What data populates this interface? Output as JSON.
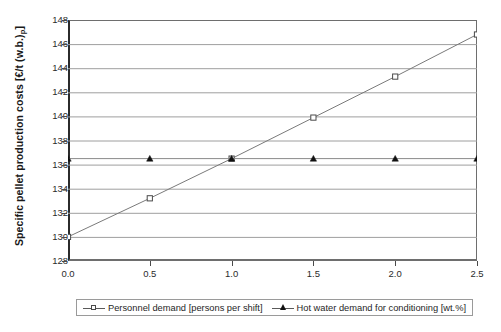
{
  "chart_data": {
    "type": "line",
    "title": "",
    "xlabel": "",
    "ylabel_text": "Specific pellet production costs [€/t (w.b.)",
    "ylabel_sub": "p",
    "ylabel_tail": "]",
    "ylabel_full": "Specific pellet production costs [€/t (w.b.)p]",
    "x": [
      0.0,
      0.5,
      1.0,
      1.5,
      2.0,
      2.5
    ],
    "xtick_labels": [
      "0.0",
      "0.5",
      "1.0",
      "1.5",
      "2.0",
      "2.5"
    ],
    "ytick_labels": [
      "148",
      "146",
      "144",
      "142",
      "140",
      "138",
      "136",
      "134",
      "132",
      "130",
      "128"
    ],
    "yticks": [
      148,
      146,
      144,
      142,
      140,
      138,
      136,
      134,
      132,
      130,
      128
    ],
    "xlim": [
      0.0,
      2.5
    ],
    "ylim": [
      128,
      148
    ],
    "grid": "horizontal",
    "legend_position": "bottom-outside",
    "series": [
      {
        "name": "Personnel demand [persons per shift]",
        "marker": "open-square",
        "values": [
          130.0,
          133.2,
          136.5,
          139.9,
          143.3,
          146.8
        ]
      },
      {
        "name": "Hot water demand for conditioning [wt.%]",
        "marker": "filled-triangle",
        "values": [
          136.5,
          136.5,
          136.5,
          136.5,
          136.5,
          136.5
        ]
      }
    ]
  },
  "legend": {
    "entries": [
      {
        "label": "Personnel demand [persons per shift]",
        "marker": "open-square"
      },
      {
        "label": "Hot water demand for conditioning [wt.%]",
        "marker": "filled-triangle"
      }
    ]
  },
  "colors": {
    "series1_line": "#7a7a7a",
    "series1_marker": "#4a4a4a",
    "series2_line": "#8a8a8a",
    "series2_marker": "#111111",
    "grid": "#9e9e9e",
    "axis": "#2b2b2b",
    "background": "#ffffff"
  }
}
